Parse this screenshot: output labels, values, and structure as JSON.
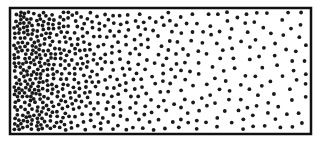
{
  "diagram": {
    "title": "",
    "background_color": "#ffffff",
    "frame": {
      "x": 10,
      "y": 8,
      "width": 301,
      "height": 126,
      "stroke_color": "#111111",
      "stroke_width": 2.5
    },
    "dots": {
      "color": "#1a1a1a",
      "radius": 1.9,
      "count": 620,
      "seed": 1337,
      "density_profile": "decreasing-left-to-right",
      "left_density": 1.0,
      "right_density": 0.12
    }
  }
}
